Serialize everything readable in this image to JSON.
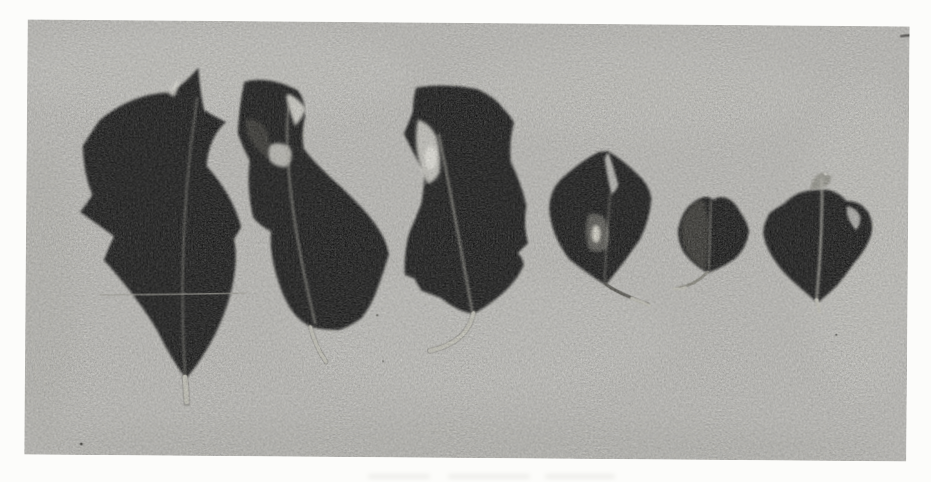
{
  "meta": {
    "media": "black-and-white halftone photograph (scanned book plate)",
    "alt": "Six dark pressed leaves of decreasing size arranged in a horizontal row on a pale gray mottled background"
  },
  "colors": {
    "page_bg": "#fcfcfa",
    "photo_bg": "#c8c7c3",
    "photo_bg_light": "#d8d7d2",
    "photo_bg_dark": "#b7b6b1",
    "leaf_dark": "#171715",
    "leaf_mid": "#55534c",
    "midrib_light": "#b5b4aa",
    "petiole_light": "#cfcec3",
    "petiole_dark": "#4e4d46",
    "scar_white": "#efeee6",
    "speck_dark": "#45443f"
  },
  "photo": {
    "leaf_count": 6,
    "arrangement": "single row, roughly largest at left to smallest near right, slight size rebound at far right",
    "leaves": [
      {
        "id": 1,
        "description": "large spiny-lobed holly-like leaf with thin pointed apex, pale midrib, faint crease line across blade, short pale petiole",
        "size_rank": "largest"
      },
      {
        "id": 2,
        "description": "tall curved leaf with hooked apex, white damage slit and pale patch near top, petiole curving down-right",
        "size_rank": "large"
      },
      {
        "id": 3,
        "description": "large lobed leaf with bright white scar on upper-left edge and long curved pale petiole sweeping left",
        "size_rank": "large"
      },
      {
        "id": 4,
        "description": "small heart-shaped leaf with split apex showing background and pale mottled scar at center, petiole to lower right",
        "size_rank": "small"
      },
      {
        "id": 5,
        "description": "smallest rounded notched leaf, left half lighter toned, petiole curving down-left",
        "size_rank": "smallest"
      },
      {
        "id": 6,
        "description": "small wide leaf with curled hooked lobes, pale curled tip and prominent pale midrib",
        "size_rank": "small"
      }
    ],
    "artifacts": [
      "halftone print grain over entire photograph",
      "faint horizontal crease across leaf 1",
      "small dark dash at top-right photo edge",
      "dust specks near leaf bases and lower-left corner",
      "very faint caption ghost below the photograph"
    ]
  }
}
